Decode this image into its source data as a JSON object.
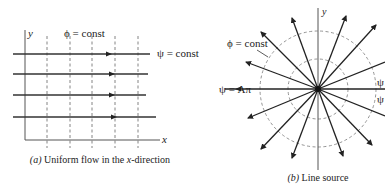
{
  "figure_a": {
    "caption_prefix": "(a)",
    "caption_text": " Uniform flow in the ",
    "caption_var": "x",
    "caption_suffix": "-direction",
    "y_axis_label": "y",
    "x_axis_label": "x",
    "potential_label": "ϕ = const",
    "stream_label": "ψ = const",
    "equipotential_count": 5,
    "streamline_count": 4
  },
  "figure_b": {
    "caption_prefix": "(b)",
    "caption_text": " Line source",
    "y_axis_label": "y",
    "potential_label": "ϕ = const",
    "stream_label_left": "ψ = Aπ",
    "stream_label_right_top": "ψ",
    "stream_label_right_bottom": "ψ",
    "ray_count": 16,
    "circle_count": 2
  }
}
